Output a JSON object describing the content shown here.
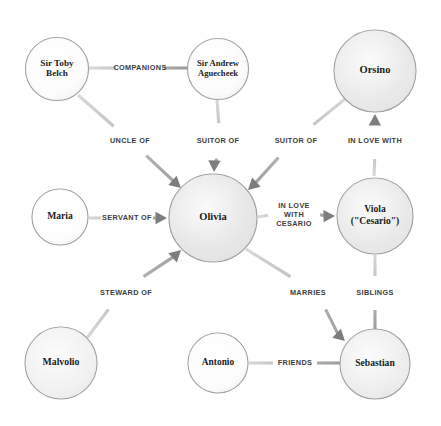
{
  "diagram": {
    "background_color": "#ffffff",
    "node_stroke_color": "#9a9a9a",
    "edge_color": "#b3b3b3",
    "arrow_color": "#7d7d7d",
    "label_color": "#3d3d3d",
    "node_text_color": "#1c1c1c"
  },
  "nodes": [
    {
      "id": "toby",
      "label_lines": [
        "Sir Toby",
        "Belch"
      ],
      "cx": 57,
      "cy": 69,
      "r": 31.5,
      "fill": "#fcfcfc",
      "font_size": 9.2
    },
    {
      "id": "andrew",
      "label_lines": [
        "Sir Andrew",
        "Aguecheek"
      ],
      "cx": 218,
      "cy": 69,
      "r": 30.5,
      "fill": "#fcfcfc",
      "font_size": 8.6
    },
    {
      "id": "orsino",
      "label_lines": [
        "Orsino"
      ],
      "cx": 375,
      "cy": 71,
      "r": 41,
      "fill": "#e6e6e6",
      "font_size": 10.5
    },
    {
      "id": "maria",
      "label_lines": [
        "Maria"
      ],
      "cx": 60,
      "cy": 217,
      "r": 28,
      "fill": "#fdfdfd",
      "font_size": 9.6
    },
    {
      "id": "olivia",
      "label_lines": [
        "Olivia"
      ],
      "cx": 213,
      "cy": 218,
      "r": 44,
      "fill": "#e3e3e3",
      "font_size": 10.5
    },
    {
      "id": "viola",
      "label_lines": [
        "Viola",
        "(\"Cesario\")"
      ],
      "cx": 375,
      "cy": 216,
      "r": 38,
      "fill": "#e6e6e6",
      "font_size": 9.6
    },
    {
      "id": "malvolio",
      "label_lines": [
        "Malvolio"
      ],
      "cx": 61,
      "cy": 363,
      "r": 36,
      "fill": "#efefef",
      "font_size": 9.8
    },
    {
      "id": "antonio",
      "label_lines": [
        "Antonio"
      ],
      "cx": 218,
      "cy": 363,
      "r": 30,
      "fill": "#fcfcfc",
      "font_size": 9.4
    },
    {
      "id": "sebastian",
      "label_lines": [
        "Sebastian"
      ],
      "cx": 375,
      "cy": 364,
      "r": 35,
      "fill": "#ebebeb",
      "font_size": 9.6
    }
  ],
  "edges": [
    {
      "id": "toby-andrew",
      "label_lines": [
        "COMPANIONS"
      ],
      "source": "toby",
      "target": "andrew",
      "x1": 89,
      "y1": 68,
      "x2": 187,
      "y2": 68,
      "label_x": 140,
      "label_y": 68,
      "gap_before": 24,
      "gap_after": 24,
      "arrow": false
    },
    {
      "id": "toby-olivia",
      "label_lines": [
        "UNCLE OF"
      ],
      "source": "toby",
      "target": "olivia",
      "x1": 78,
      "y1": 95,
      "x2": 181,
      "y2": 188,
      "label_x": 130,
      "label_y": 141,
      "gap_before": 22,
      "gap_after": 22,
      "arrow": true
    },
    {
      "id": "andrew-olivia",
      "label_lines": [
        "SUITOR OF"
      ],
      "source": "andrew",
      "target": "olivia",
      "x1": 217,
      "y1": 100,
      "x2": 214,
      "y2": 172,
      "label_x": 218,
      "label_y": 141,
      "gap_before": 18,
      "gap_after": 18,
      "arrow": true
    },
    {
      "id": "orsino-olivia",
      "label_lines": [
        "SUITOR OF"
      ],
      "source": "orsino",
      "target": "olivia",
      "x1": 345,
      "y1": 99,
      "x2": 248,
      "y2": 190,
      "label_x": 296,
      "label_y": 141,
      "gap_before": 24,
      "gap_after": 24,
      "arrow": true
    },
    {
      "id": "viola-orsino",
      "label_lines": [
        "IN LOVE WITH"
      ],
      "source": "viola",
      "target": "orsino",
      "x1": 374,
      "y1": 176,
      "x2": 375,
      "y2": 114,
      "label_x": 375,
      "label_y": 141,
      "gap_before": 18,
      "gap_after": 18,
      "arrow": true
    },
    {
      "id": "maria-olivia",
      "label_lines": [
        "SERVANT OF"
      ],
      "source": "maria",
      "target": "olivia",
      "x1": 89,
      "y1": 218,
      "x2": 167,
      "y2": 218,
      "label_x": 127,
      "label_y": 218,
      "gap_before": 26,
      "gap_after": 26,
      "arrow": true
    },
    {
      "id": "olivia-viola",
      "label_lines": [
        "IN LOVE",
        "WITH",
        "CESARIO"
      ],
      "source": "olivia",
      "target": "viola",
      "x1": 258,
      "y1": 217,
      "x2": 335,
      "y2": 216,
      "label_x": 294,
      "label_y": 215,
      "gap_before": 26,
      "gap_after": 26,
      "arrow": true
    },
    {
      "id": "malvolio-olivia",
      "label_lines": [
        "STEWARD OF"
      ],
      "source": "malvolio",
      "target": "olivia",
      "x1": 87,
      "y1": 338,
      "x2": 181,
      "y2": 250,
      "label_x": 126,
      "label_y": 293,
      "gap_before": 24,
      "gap_after": 24,
      "arrow": true
    },
    {
      "id": "olivia-sebastian",
      "label_lines": [
        "MARRIES"
      ],
      "source": "olivia",
      "target": "sebastian",
      "x1": 246,
      "y1": 249,
      "x2": 345,
      "y2": 341,
      "label_x": 308,
      "label_y": 293,
      "gap_before": 24,
      "gap_after": 24,
      "arrow": true
    },
    {
      "id": "viola-sebastian",
      "label_lines": [
        "SIBLINGS"
      ],
      "source": "viola",
      "target": "sebastian",
      "x1": 375,
      "y1": 255,
      "x2": 375,
      "y2": 330,
      "label_x": 375,
      "label_y": 293,
      "gap_before": 17,
      "gap_after": 17,
      "arrow": false
    },
    {
      "id": "antonio-sebastian",
      "label_lines": [
        "FRIENDS"
      ],
      "source": "antonio",
      "target": "sebastian",
      "x1": 249,
      "y1": 363,
      "x2": 341,
      "y2": 363,
      "label_x": 295,
      "label_y": 363,
      "gap_before": 22,
      "gap_after": 22,
      "arrow": false
    }
  ]
}
